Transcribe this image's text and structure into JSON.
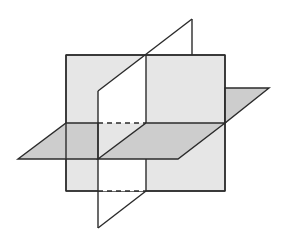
{
  "diagram": {
    "colors": {
      "background": "#ffffff",
      "back_plane_fill": "#e6e6e6",
      "horizontal_plane_fill": "#cdcdcd",
      "vertical_plane_fill": "#ffffff",
      "stroke": "#2b2b2b"
    },
    "planes": [
      {
        "name": "back-vertical-plane",
        "shape": "rectangle",
        "x": 66,
        "y": 55,
        "width": 159,
        "height": 136
      },
      {
        "name": "horizontal-plane",
        "shape": "parallelogram"
      },
      {
        "name": "oblique-vertical-plane",
        "shape": "parallelogram"
      }
    ],
    "hidden_lines": "dashed"
  }
}
